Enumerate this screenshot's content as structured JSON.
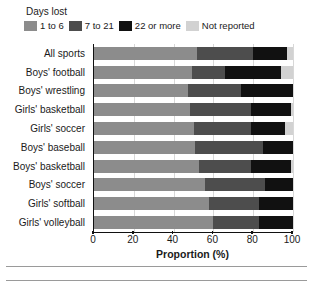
{
  "legend": {
    "title": "Days lost",
    "items": [
      {
        "label": "1 to 6",
        "color": "#8c8c8c",
        "key": "d1_6"
      },
      {
        "label": "7 to 21",
        "color": "#4d4d4d",
        "key": "d7_21"
      },
      {
        "label": "22 or more",
        "color": "#111111",
        "key": "d22plus"
      },
      {
        "label": "Not reported",
        "color": "#d2d2d2",
        "key": "not_reported"
      }
    ]
  },
  "axis": {
    "x_title": "Proportion (%)",
    "x_ticks": [
      0,
      20,
      40,
      60,
      80,
      100
    ],
    "x_tick_labels": [
      "0",
      "20",
      "40",
      "60",
      "80",
      "100"
    ],
    "x_min": 0,
    "x_max": 100
  },
  "chart_data": {
    "type": "bar",
    "orientation": "horizontal",
    "stacked": true,
    "stack_mode": "percent",
    "title": "",
    "subtitle": "",
    "xlabel": "Proportion (%)",
    "ylabel": "",
    "xlim": [
      0,
      100
    ],
    "xticks": [
      0,
      20,
      40,
      60,
      80,
      100
    ],
    "grid": "vertical",
    "legend_title": "Days lost",
    "legend_position": "top-left",
    "categories": [
      "All sports",
      "Boys' football",
      "Boys' wrestling",
      "Girls' basketball",
      "Girls' soccer",
      "Boys' baseball",
      "Boys' basketball",
      "Boys' soccer",
      "Girls' softball",
      "Girls' volleyball"
    ],
    "series": [
      {
        "name": "1 to 6",
        "color": "#8c8c8c",
        "values": [
          52,
          49,
          47,
          48,
          50,
          51,
          53,
          56,
          58,
          60
        ]
      },
      {
        "name": "7 to 21",
        "color": "#4d4d4d",
        "values": [
          28,
          17,
          27,
          31,
          29,
          34,
          26,
          30,
          25,
          23
        ]
      },
      {
        "name": "22 or more",
        "color": "#111111",
        "values": [
          17,
          28,
          26,
          20,
          17,
          15,
          20,
          14,
          17,
          17
        ]
      },
      {
        "name": "Not reported",
        "color": "#d2d2d2",
        "values": [
          3,
          6,
          0,
          1,
          4,
          0,
          1,
          0,
          0,
          0
        ]
      }
    ]
  }
}
